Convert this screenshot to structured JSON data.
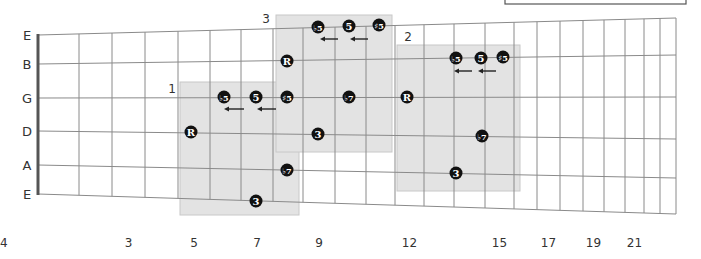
{
  "diagram": {
    "string_labels": [
      "E",
      "B",
      "G",
      "D",
      "A",
      "E"
    ],
    "fret_numbers": [
      {
        "fret": 3,
        "label": "3"
      },
      {
        "fret": 5,
        "label": "5"
      },
      {
        "fret": 7,
        "label": "7"
      },
      {
        "fret": 9,
        "label": "9"
      },
      {
        "fret": 12,
        "label": "12"
      },
      {
        "fret": 15,
        "label": "15"
      },
      {
        "fret": 17,
        "label": "17"
      },
      {
        "fret": 19,
        "label": "19"
      },
      {
        "fret": 21,
        "label": "21"
      },
      {
        "fret": 24,
        "label": "24"
      }
    ],
    "fret_x": [
      38,
      79,
      112,
      145,
      178,
      210,
      241,
      273,
      303,
      335,
      366,
      395,
      424,
      454,
      485,
      514,
      537,
      560,
      583,
      604,
      625,
      644,
      660,
      676
    ],
    "string_y_left": [
      35,
      64,
      98,
      131,
      165,
      194
    ],
    "string_y_right": [
      18,
      55,
      97,
      139,
      178,
      214
    ],
    "colors": {
      "background": "#ffffff",
      "grid": "#8a8a8a",
      "nut": "#555555",
      "box": "#e3e3e3",
      "box_border": "#c8c8c8",
      "note": "#111111",
      "note_text": "#ffffff",
      "label": "#333333"
    },
    "positions": [
      {
        "label": "1",
        "label_xy": [
          172,
          93
        ],
        "box": {
          "x": 180,
          "y": 82,
          "w": 119,
          "h": 133
        },
        "notes": [
          {
            "x": 191,
            "y": 132,
            "text": "R"
          },
          {
            "x": 224,
            "y": 97,
            "text": "♭5"
          },
          {
            "x": 256,
            "y": 97,
            "text": "5"
          },
          {
            "x": 287,
            "y": 97,
            "text": "♯5"
          },
          {
            "x": 287,
            "y": 170,
            "text": "♭7"
          },
          {
            "x": 256,
            "y": 201,
            "text": "3"
          }
        ],
        "arrows": [
          {
            "x1": 244,
            "x2": 224,
            "y": 109
          },
          {
            "x1": 276,
            "x2": 257,
            "y": 109
          }
        ]
      },
      {
        "label": "3",
        "label_xy": [
          266,
          23
        ],
        "box": {
          "x": 276,
          "y": 15,
          "w": 116,
          "h": 137
        },
        "notes": [
          {
            "x": 287,
            "y": 61,
            "text": "R"
          },
          {
            "x": 318,
            "y": 27,
            "text": "♭5"
          },
          {
            "x": 349,
            "y": 26,
            "text": "5"
          },
          {
            "x": 379,
            "y": 25,
            "text": "♯5"
          },
          {
            "x": 349,
            "y": 97,
            "text": "♭7"
          },
          {
            "x": 318,
            "y": 134,
            "text": "3"
          }
        ],
        "arrows": [
          {
            "x1": 338,
            "x2": 320,
            "y": 39
          },
          {
            "x1": 368,
            "x2": 350,
            "y": 39
          }
        ]
      },
      {
        "label": "2",
        "label_xy": [
          408,
          41
        ],
        "box": {
          "x": 397,
          "y": 45,
          "w": 123,
          "h": 146
        },
        "notes": [
          {
            "x": 407,
            "y": 97,
            "text": "R"
          },
          {
            "x": 456,
            "y": 58,
            "text": "♭5"
          },
          {
            "x": 481,
            "y": 58,
            "text": "5"
          },
          {
            "x": 503,
            "y": 57,
            "text": "♯5"
          },
          {
            "x": 482,
            "y": 136,
            "text": "♭7"
          },
          {
            "x": 456,
            "y": 173,
            "text": "3"
          }
        ],
        "arrows": [
          {
            "x1": 472,
            "x2": 454,
            "y": 71
          },
          {
            "x1": 496,
            "x2": 478,
            "y": 71
          }
        ]
      }
    ],
    "legend_box": {
      "x": 505,
      "y": 0,
      "w": 181,
      "h": 4
    }
  }
}
